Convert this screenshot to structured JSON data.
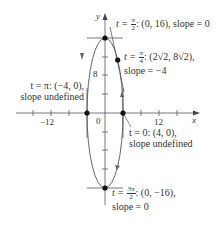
{
  "figure": {
    "curve": {
      "x_expr": "4cos t",
      "y_expr": "16 sin t",
      "cx_px": 105,
      "cy_px": 113,
      "rx_px": 18,
      "ry_px": 75,
      "color": "#555555"
    },
    "axes": {
      "x_label": "x",
      "y_label": "y",
      "x_tick_labels": [
        "−12",
        "0",
        "12"
      ],
      "y_tick_labels": [
        "8"
      ],
      "x_tick_step": 4,
      "y_tick_step": 4
    },
    "points": [
      {
        "id": "pi_over_2",
        "t_num": "π",
        "t_den": "2",
        "coord": ": (0, 16), slope = 0"
      },
      {
        "id": "pi_over_4",
        "t_num": "π",
        "t_den": "4",
        "coord": ": (2√2, 8√2),",
        "line2": "slope = −4"
      },
      {
        "id": "pi",
        "t_text": "t = π: (−4, 0),",
        "line2": "slope undefined"
      },
      {
        "id": "zero",
        "t_text": "t = 0: (4, 0),",
        "line2": "slope undefined"
      },
      {
        "id": "three_pi_over_2",
        "t_num": "3π",
        "t_den": "2",
        "coord": ": (0, −16),",
        "line2": "slope = 0"
      }
    ],
    "t_prefix": "t = "
  }
}
